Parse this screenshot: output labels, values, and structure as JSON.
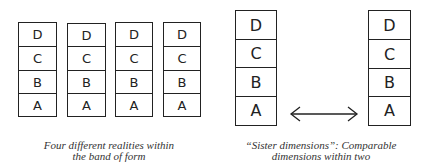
{
  "left_figure": {
    "columns": [
      {
        "cells": [
          "D",
          "C",
          "B",
          "A"
        ]
      },
      {
        "cells": [
          "D",
          "C",
          "B",
          "A"
        ]
      },
      {
        "cells": [
          "D",
          "C",
          "B",
          "A"
        ]
      },
      {
        "cells": [
          "D",
          "C",
          "B",
          "A"
        ]
      }
    ],
    "caption_line1": "Four different realities within",
    "caption_line2": "the band of form"
  },
  "right_figure": {
    "columns": [
      {
        "cells": [
          "D",
          "C",
          "B",
          "A"
        ]
      },
      {
        "cells": [
          "D",
          "C",
          "B",
          "A"
        ]
      }
    ],
    "arrow": "double-headed-arrow",
    "caption_line1": "“Sister dimensions”: Comparable",
    "caption_line2": "dimensions within two"
  }
}
